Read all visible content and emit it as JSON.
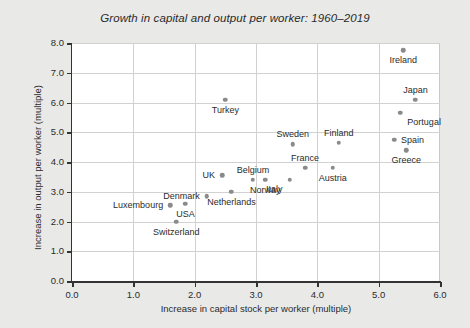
{
  "chart_data": {
    "type": "scatter",
    "title": "Growth in capital and output per worker: 1960–2019",
    "xlabel": "Increase in capital stock per worker (multiple)",
    "ylabel": "Increase in output per worker (multiple)",
    "xlim": [
      0.0,
      6.0
    ],
    "ylim": [
      0.0,
      8.0
    ],
    "xticks": [
      "0.0",
      "1.0",
      "2.0",
      "3.0",
      "4.0",
      "5.0",
      "6.0"
    ],
    "yticks": [
      "0.0",
      "1.0",
      "2.0",
      "3.0",
      "4.0",
      "5.0",
      "6.0",
      "7.0",
      "8.0"
    ],
    "grid": true,
    "legend": "none",
    "marker_color": "#8a8a8a",
    "points": [
      {
        "label": "Ireland",
        "x": 5.4,
        "y": 7.75,
        "label_pos": "below"
      },
      {
        "label": "Japan",
        "x": 5.6,
        "y": 6.1,
        "label_pos": "above"
      },
      {
        "label": "Turkey",
        "x": 2.5,
        "y": 6.1,
        "label_pos": "below"
      },
      {
        "label": "Portugal",
        "x": 5.35,
        "y": 5.65,
        "label_pos": "below-right"
      },
      {
        "label": "Spain",
        "x": 5.25,
        "y": 4.75,
        "label_pos": "right"
      },
      {
        "label": "Finland",
        "x": 4.35,
        "y": 4.65,
        "label_pos": "above"
      },
      {
        "label": "Sweden",
        "x": 3.6,
        "y": 4.6,
        "label_pos": "above"
      },
      {
        "label": "Greece",
        "x": 5.45,
        "y": 4.4,
        "label_pos": "below"
      },
      {
        "label": "France",
        "x": 3.8,
        "y": 3.8,
        "label_pos": "above"
      },
      {
        "label": "Austria",
        "x": 4.25,
        "y": 3.8,
        "label_pos": "below"
      },
      {
        "label": "UK",
        "x": 2.45,
        "y": 3.55,
        "label_pos": "left"
      },
      {
        "label": "Belgium",
        "x": 2.95,
        "y": 3.4,
        "label_pos": "above"
      },
      {
        "label": "Norway",
        "x": 3.15,
        "y": 3.4,
        "label_pos": "below"
      },
      {
        "label": "Italy",
        "x": 3.55,
        "y": 3.4,
        "label_pos": "below-left"
      },
      {
        "label": "Netherlands",
        "x": 2.6,
        "y": 3.0,
        "label_pos": "below"
      },
      {
        "label": "Denmark",
        "x": 2.2,
        "y": 2.85,
        "label_pos": "left"
      },
      {
        "label": "USA",
        "x": 1.85,
        "y": 2.6,
        "label_pos": "below"
      },
      {
        "label": "Luxembourg",
        "x": 1.6,
        "y": 2.55,
        "label_pos": "left"
      },
      {
        "label": "Switzerland",
        "x": 1.7,
        "y": 2.0,
        "label_pos": "below"
      }
    ]
  }
}
